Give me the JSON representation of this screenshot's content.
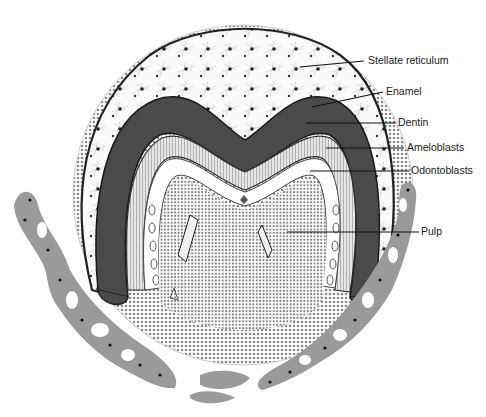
{
  "diagram": {
    "labels": [
      {
        "id": "stellate-reticulum",
        "text": "Stellate reticulum",
        "x": 368,
        "y": 55,
        "line": [
          300,
          67,
          364,
          61
        ]
      },
      {
        "id": "enamel",
        "text": "Enamel",
        "x": 386,
        "y": 86,
        "line": [
          312,
          107,
          383,
          92
        ]
      },
      {
        "id": "dentin",
        "text": "Dentin",
        "x": 398,
        "y": 117,
        "line": [
          306,
          123,
          396,
          123
        ]
      },
      {
        "id": "ameloblasts",
        "text": "Ameloblasts",
        "x": 407,
        "y": 142,
        "line": [
          326,
          148,
          404,
          148
        ]
      },
      {
        "id": "odontoblasts",
        "text": "Odontoblasts",
        "x": 411,
        "y": 165,
        "line": [
          310,
          171,
          409,
          171
        ]
      },
      {
        "id": "pulp",
        "text": "Pulp",
        "x": 421,
        "y": 226,
        "line": [
          287,
          232,
          419,
          232
        ]
      }
    ],
    "colors": {
      "dental_follicle": "#b8b8b8",
      "stellate_reticulum": "#f4f4f4",
      "enamel_layer": "#4a4a4a",
      "dentin_layer": "#d8d8d8",
      "pulp": "#c4c4c4",
      "bone": "#9a9a9a",
      "outline": "#222222"
    }
  }
}
